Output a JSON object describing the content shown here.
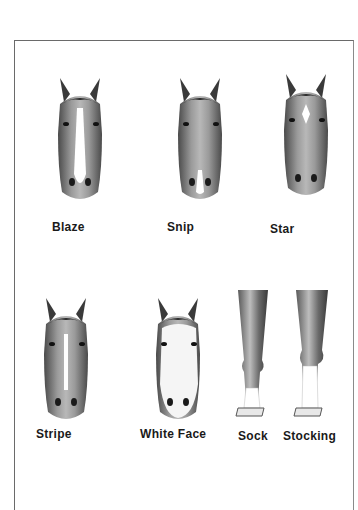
{
  "page": {
    "face_markings": [
      {
        "id": "blaze",
        "label": "Blaze"
      },
      {
        "id": "snip",
        "label": "Snip"
      },
      {
        "id": "star",
        "label": "Star"
      },
      {
        "id": "stripe",
        "label": "Stripe"
      },
      {
        "id": "white-face",
        "label": "White Face"
      }
    ],
    "leg_markings": [
      {
        "id": "sock",
        "label": "Sock"
      },
      {
        "id": "stocking",
        "label": "Stocking"
      }
    ]
  },
  "colors": {
    "ink": "#1a1a1a",
    "coat_dark": "#3a3a3a",
    "coat_mid": "#8a8a8a",
    "coat_light": "#c8c8c8",
    "white_marking": "#ffffff",
    "frame": "#6a6a6a"
  }
}
